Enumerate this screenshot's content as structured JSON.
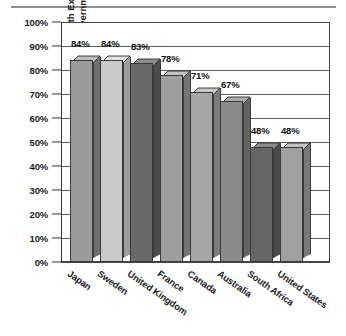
{
  "chart_data": {
    "type": "bar",
    "title": "",
    "xlabel": "",
    "ylabel": "Percentage of Health Expenditures Paid by Government",
    "ylabel_line1": "Percentage of Health Expenditures",
    "ylabel_line2": "Paid by Government",
    "categories": [
      "Japan",
      "Sweden",
      "United Kingdom",
      "France",
      "Canada",
      "Australia",
      "South Africa",
      "United States"
    ],
    "values": [
      84,
      84,
      83,
      78,
      71,
      67,
      48,
      48
    ],
    "value_labels": [
      "84%",
      "84%",
      "83%",
      "78%",
      "71%",
      "67%",
      "48%",
      "48%"
    ],
    "ylim": [
      0,
      100
    ],
    "ytick_values": [
      0,
      10,
      20,
      30,
      40,
      50,
      60,
      70,
      80,
      90,
      100
    ],
    "ytick_labels": [
      "0%",
      "10%",
      "20%",
      "30%",
      "40%",
      "50%",
      "60%",
      "70%",
      "80%",
      "90%",
      "100%"
    ],
    "grid": true,
    "legend": "none",
    "style": "3d-bar-grayscale",
    "bar_colors": [
      "#9a9a9a",
      "#c9c9c9",
      "#6a6a6a",
      "#9e9e9e",
      "#a6a6a6",
      "#8a8a8a",
      "#666666",
      "#a0a0a0"
    ],
    "bar_side_colors": [
      "#6f6f6f",
      "#9d9d9d",
      "#4c4c4c",
      "#757575",
      "#7c7c7c",
      "#646464",
      "#4a4a4a",
      "#787878"
    ],
    "bar_top_colors": [
      "#bdbdbd",
      "#e2e2e2",
      "#8e8e8e",
      "#c0c0c0",
      "#c6c6c6",
      "#ababab",
      "#8a8a8a",
      "#c2c2c2"
    ]
  },
  "axis": {
    "frame_color": "#444444",
    "grid_color": "#5a5a5a",
    "tick_color": "#333333"
  },
  "decor": {
    "top_rule_color": "#8d8d8d"
  }
}
